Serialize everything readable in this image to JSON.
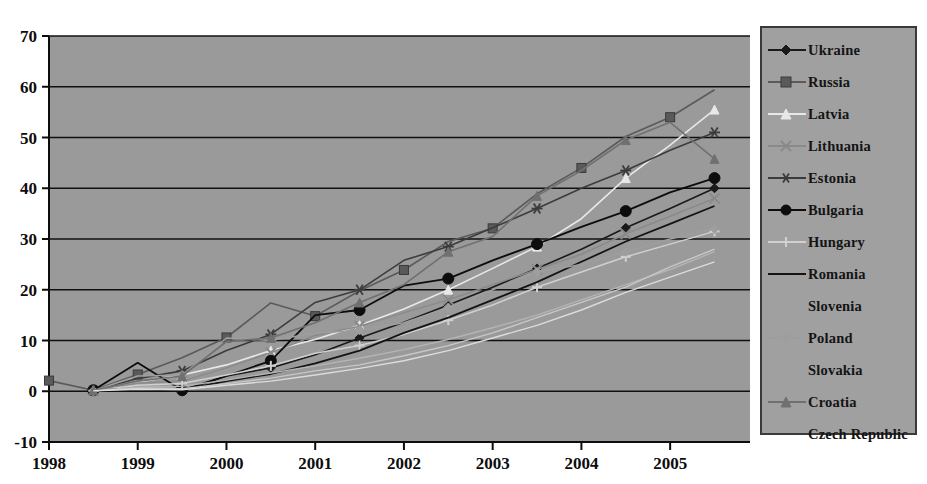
{
  "chart_data": {
    "type": "line",
    "title": "",
    "subtitle": "",
    "xlabel": "",
    "ylabel": "",
    "x": [
      1998,
      1998.5,
      1999,
      1999.5,
      2000,
      2000.5,
      2001,
      2001.5,
      2002,
      2002.5,
      2003,
      2003.5,
      2004,
      2004.5,
      2005,
      2005.5
    ],
    "x_tick_labels": [
      "1998",
      "1999",
      "2000",
      "2001",
      "2002",
      "2003",
      "2004",
      "2005"
    ],
    "x_ticks": [
      1998,
      1999,
      2000,
      2001,
      2002,
      2003,
      2004,
      2005
    ],
    "xlim": [
      1998,
      2005.9
    ],
    "y_tick_labels": [
      "-10",
      "0",
      "10",
      "20",
      "30",
      "40",
      "50",
      "60",
      "70"
    ],
    "y_ticks": [
      -10,
      0,
      10,
      20,
      30,
      40,
      50,
      60,
      70
    ],
    "ylim": [
      -10,
      70
    ],
    "grid": "horizontal",
    "legend_position": "right-outside",
    "plot_background": "#9a9a9a",
    "page_background": "#ffffff",
    "series": [
      {
        "name": "Ukraine",
        "color": "#1a1a1a",
        "marker": "diamond",
        "marker_size": 9,
        "line_width": 1.6,
        "x": [
          1998.5,
          1999,
          1999.5,
          2000,
          2000.5,
          2001,
          2001.5,
          2002,
          2002.5,
          2003,
          2003.5,
          2004,
          2004.5,
          2005,
          2005.5
        ],
        "values": [
          0.2,
          0.3,
          0.1,
          3.0,
          4.6,
          7.2,
          10.5,
          13.6,
          17.0,
          20.5,
          24.2,
          28.0,
          32.2,
          36.0,
          40.0
        ]
      },
      {
        "name": "Russia",
        "color": "#5a5a5a",
        "marker": "square",
        "marker_size": 9,
        "line_width": 1.6,
        "x": [
          1998,
          1998.5,
          1999,
          1999.5,
          2000,
          2000.5,
          2001,
          2001.5,
          2002,
          2002.5,
          2003,
          2003.5,
          2004,
          2004.5,
          2005,
          2005.5
        ],
        "values": [
          2.1,
          0.2,
          3.3,
          6.6,
          10.6,
          17.4,
          14.8,
          19.8,
          23.9,
          29.5,
          32.1,
          38.9,
          44.0,
          50.2,
          54.0,
          59.4
        ]
      },
      {
        "name": "Latvia",
        "color": "#e8e8e8",
        "marker": "triangle",
        "marker_size": 9,
        "line_width": 1.6,
        "x": [
          1998.5,
          1999,
          1999.5,
          2000,
          2000.5,
          2001,
          2001.5,
          2002,
          2002.5,
          2003,
          2003.5,
          2004,
          2004.5,
          2005,
          2005.5
        ],
        "values": [
          0.1,
          1.8,
          3.2,
          5.2,
          8.0,
          10.2,
          13.0,
          16.2,
          20.0,
          24.2,
          28.5,
          34.0,
          42.0,
          48.5,
          55.5
        ]
      },
      {
        "name": "Lithuania",
        "color": "#8a8a8a",
        "marker": "x",
        "marker_size": 10,
        "line_width": 1.5,
        "x": [
          1998.5,
          1999,
          1999.5,
          2000,
          2000.5,
          2001,
          2001.5,
          2002,
          2002.5,
          2003,
          2003.5,
          2004,
          2004.5,
          2005,
          2005.5
        ],
        "values": [
          0.1,
          1.6,
          2.0,
          4.6,
          7.6,
          11.0,
          12.8,
          15.5,
          18.0,
          21.0,
          24.0,
          27.0,
          31.0,
          34.5,
          38.0
        ]
      },
      {
        "name": "Estonia",
        "color": "#3c3c3c",
        "marker": "asterisk",
        "marker_size": 11,
        "line_width": 1.6,
        "x": [
          1998.5,
          1999,
          1999.5,
          2000,
          2000.5,
          2001,
          2001.5,
          2002,
          2002.5,
          2003,
          2003.5,
          2004,
          2004.5,
          2005,
          2005.5
        ],
        "values": [
          0.2,
          2.5,
          4.0,
          8.0,
          11.2,
          17.5,
          20.0,
          25.8,
          28.5,
          32.2,
          36.0,
          40.0,
          43.5,
          47.5,
          51.0
        ]
      },
      {
        "name": "Bulgaria",
        "color": "#0d0d0d",
        "marker": "circle",
        "marker_size": 11,
        "line_width": 1.8,
        "x": [
          1998.5,
          1999,
          1999.5,
          2000,
          2000.5,
          2001,
          2001.5,
          2002,
          2002.5,
          2003,
          2003.5,
          2004,
          2004.5,
          2005,
          2005.5
        ],
        "values": [
          0.2,
          5.6,
          0.2,
          3.0,
          6.0,
          15.0,
          16.0,
          20.8,
          22.2,
          25.8,
          29.0,
          32.4,
          35.5,
          39.2,
          42.0
        ]
      },
      {
        "name": "Hungary",
        "color": "#d0d0d0",
        "marker": "plus",
        "marker_size": 10,
        "line_width": 1.5,
        "x": [
          1998.5,
          1999,
          1999.5,
          2000,
          2000.5,
          2001,
          2001.5,
          2002,
          2002.5,
          2003,
          2003.5,
          2004,
          2004.5,
          2005,
          2005.5
        ],
        "values": [
          0.1,
          1.2,
          1.5,
          3.2,
          5.0,
          7.5,
          9.0,
          11.2,
          14.0,
          17.0,
          20.5,
          23.5,
          26.5,
          29.0,
          31.5
        ]
      },
      {
        "name": "Romania",
        "color": "#141414",
        "marker": "none",
        "marker_size": 0,
        "line_width": 1.8,
        "x": [
          1998.5,
          1999,
          1999.5,
          2000,
          2000.5,
          2001,
          2001.5,
          2002,
          2002.5,
          2003,
          2003.5,
          2004,
          2004.5,
          2005,
          2005.5
        ],
        "values": [
          0.2,
          0.5,
          0.3,
          2.0,
          3.4,
          5.5,
          8.0,
          11.5,
          14.5,
          18.0,
          21.5,
          25.5,
          29.5,
          33.0,
          36.5
        ]
      },
      {
        "name": "Slovenia",
        "color": "#b4b4b4",
        "marker": "none",
        "marker_size": 0,
        "line_width": 1.4,
        "x": [
          1998.5,
          1999,
          1999.5,
          2000,
          2000.5,
          2001,
          2001.5,
          2002,
          2002.5,
          2003,
          2003.5,
          2004,
          2004.5,
          2005,
          2005.5
        ],
        "values": [
          0.1,
          0.8,
          1.0,
          2.2,
          3.6,
          5.0,
          6.5,
          8.2,
          10.2,
          12.5,
          15.0,
          18.0,
          21.0,
          24.0,
          27.5
        ]
      },
      {
        "name": "Poland",
        "color": "#9e9e9e",
        "marker": "diamond",
        "marker_size": 9,
        "line_width": 1.5,
        "x": [
          1998.5,
          1999,
          1999.5,
          2000,
          2000.5,
          2001,
          2001.5,
          2002,
          2002.5,
          2003,
          2003.5,
          2004,
          2004.5,
          2005,
          2005.5
        ],
        "values": [
          0.1,
          3.0,
          3.2,
          10.5,
          10.0,
          11.5,
          12.0,
          13.5,
          16.5,
          20.0,
          23.5,
          25.0,
          27.5,
          30.0,
          32.0
        ]
      },
      {
        "name": "Slovakia",
        "color": "#c8c8c8",
        "marker": "none",
        "marker_size": 0,
        "line_width": 1.4,
        "x": [
          1998.5,
          1999,
          1999.5,
          2000,
          2000.5,
          2001,
          2001.5,
          2002,
          2002.5,
          2003,
          2003.5,
          2004,
          2004.5,
          2005,
          2005.5
        ],
        "values": [
          0.1,
          0.6,
          0.5,
          1.5,
          2.6,
          4.0,
          5.2,
          7.0,
          9.0,
          11.5,
          14.5,
          17.5,
          20.5,
          24.5,
          28.0
        ]
      },
      {
        "name": "Croatia",
        "color": "#707070",
        "marker": "triangle",
        "marker_size": 9,
        "line_width": 1.6,
        "x": [
          1998.5,
          1999,
          1999.5,
          2000,
          2000.5,
          2001,
          2001.5,
          2002,
          2002.5,
          2003,
          2003.5,
          2004,
          2004.5,
          2005,
          2005.5
        ],
        "values": [
          0.2,
          2.0,
          3.0,
          9.8,
          10.5,
          13.5,
          17.5,
          21.0,
          27.5,
          30.5,
          38.5,
          43.5,
          49.5,
          53.0,
          45.8
        ]
      },
      {
        "name": "Czech Republic",
        "color": "#dcdcdc",
        "marker": "none",
        "marker_size": 0,
        "line_width": 1.4,
        "x": [
          1998.5,
          1999,
          1999.5,
          2000,
          2000.5,
          2001,
          2001.5,
          2002,
          2002.5,
          2003,
          2003.5,
          2004,
          2004.5,
          2005,
          2005.5
        ],
        "values": [
          0.1,
          0.4,
          0.3,
          1.2,
          2.0,
          3.2,
          4.5,
          6.0,
          8.0,
          10.5,
          13.0,
          16.0,
          19.5,
          22.5,
          25.5
        ]
      }
    ]
  },
  "legend": {
    "items": [
      {
        "label": "Ukraine",
        "marker": "diamond",
        "color": "#1a1a1a",
        "show_line": true
      },
      {
        "label": "Russia",
        "marker": "square",
        "color": "#5a5a5a",
        "show_line": true
      },
      {
        "label": "Latvia",
        "marker": "triangle",
        "color": "#e8e8e8",
        "show_line": true
      },
      {
        "label": "Lithuania",
        "marker": "x",
        "color": "#8a8a8a",
        "show_line": true
      },
      {
        "label": "Estonia",
        "marker": "asterisk",
        "color": "#3c3c3c",
        "show_line": true
      },
      {
        "label": "Bulgaria",
        "marker": "circle",
        "color": "#0d0d0d",
        "show_line": true
      },
      {
        "label": "Hungary",
        "marker": "plus",
        "color": "#d0d0d0",
        "show_line": true
      },
      {
        "label": "Romania",
        "marker": "none",
        "color": "#141414",
        "show_line": true
      },
      {
        "label": "Slovenia",
        "marker": "none",
        "color": "#b4b4b4",
        "show_line": false
      },
      {
        "label": "Poland",
        "marker": "diamond",
        "color": "#9e9e9e",
        "show_line": true
      },
      {
        "label": "Slovakia",
        "marker": "none",
        "color": "#c8c8c8",
        "show_line": false
      },
      {
        "label": "Croatia",
        "marker": "triangle",
        "color": "#707070",
        "show_line": true
      },
      {
        "label": "Czech Republic",
        "marker": "none",
        "color": "#dcdcdc",
        "show_line": false
      }
    ]
  }
}
